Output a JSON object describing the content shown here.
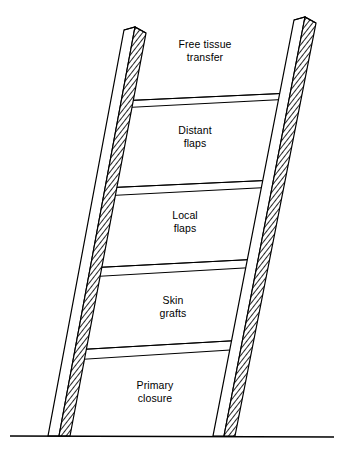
{
  "figure": {
    "name": "reconstructive-ladder",
    "title": "",
    "background_color": "#ffffff",
    "line_color": "#000000",
    "hatch_color": "#000000"
  },
  "ladder": {
    "rail_count": 2,
    "rung_count": 4,
    "ground_line": true,
    "rails": [
      {
        "name": "left-rail",
        "top_x": 124,
        "bottom_x": 49,
        "top_y": 27,
        "bottom_y": 436,
        "width_top": 22,
        "width_bottom": 18
      },
      {
        "name": "right-rail",
        "top_x": 294,
        "bottom_x": 213,
        "top_y": 17,
        "bottom_y": 436,
        "width_top": 22,
        "width_bottom": 24
      }
    ],
    "rungs": [
      {
        "name": "rung-1",
        "index": 1,
        "left_y": 99,
        "right_y": 91
      },
      {
        "name": "rung-2",
        "index": 2,
        "left_y": 186,
        "right_y": 178
      },
      {
        "name": "rung-3",
        "index": 3,
        "left_y": 266,
        "right_y": 258
      },
      {
        "name": "rung-4",
        "index": 4,
        "left_y": 348,
        "right_y": 338
      }
    ]
  },
  "labels": {
    "free_tissue_transfer": "Free tissue\ntransfer",
    "distant_flaps": "Distant\nflaps",
    "local_flaps": "Local\nflaps",
    "skin_grafts": "Skin\ngrafts",
    "primary_closure": "Primary\nclosure"
  },
  "steps": [
    {
      "order": 5,
      "label": "Free tissue transfer"
    },
    {
      "order": 4,
      "label": "Distant flaps"
    },
    {
      "order": 3,
      "label": "Local flaps"
    },
    {
      "order": 2,
      "label": "Skin grafts"
    },
    {
      "order": 1,
      "label": "Primary closure"
    }
  ]
}
